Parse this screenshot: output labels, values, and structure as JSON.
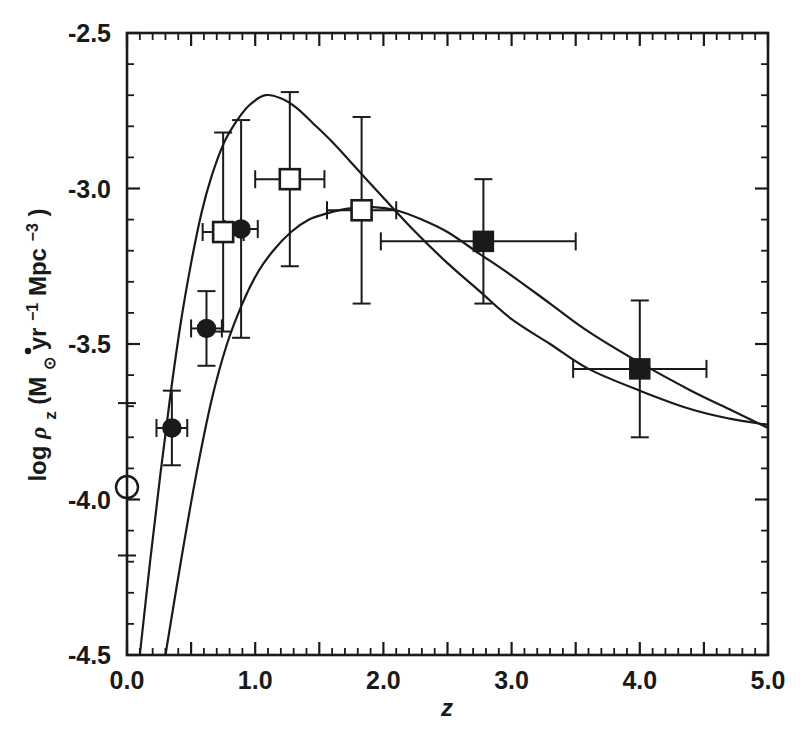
{
  "chart_data": {
    "type": "scatter",
    "title": "",
    "xlabel": "z",
    "ylabel": "log ρ̇_z (M⊙yr⁻¹ Mpc⁻³)",
    "xlim": [
      0.0,
      5.0
    ],
    "ylim": [
      -4.5,
      -2.5
    ],
    "grid": false,
    "legend": "none",
    "x_ticks": [
      "0.0",
      "1.0",
      "2.0",
      "3.0",
      "4.0",
      "5.0"
    ],
    "x_tick_values": [
      0.0,
      1.0,
      2.0,
      3.0,
      4.0,
      5.0
    ],
    "x_major_step": 0.5,
    "x_minor_step": 0.1,
    "y_ticks": [
      "-2.5",
      "-3.0",
      "-3.5",
      "-4.0",
      "-4.5"
    ],
    "y_tick_values": [
      -2.5,
      -3.0,
      -3.5,
      -4.0,
      -4.5
    ],
    "y_major_step": 0.5,
    "y_minor_step": 0.1,
    "series": [
      {
        "name": "local-uv-point",
        "marker": "open-circle",
        "points": [
          {
            "x": 0.0,
            "y": -3.96,
            "xerr_lo": 0.0,
            "xerr_hi": 0.0,
            "yerr_lo": 0.22,
            "yerr_hi": 0.27
          }
        ]
      },
      {
        "name": "filled-circles",
        "marker": "filled-circle",
        "points": [
          {
            "x": 0.35,
            "y": -3.77,
            "xerr_lo": 0.12,
            "xerr_hi": 0.12,
            "yerr_lo": 0.12,
            "yerr_hi": 0.12
          },
          {
            "x": 0.62,
            "y": -3.45,
            "xerr_lo": 0.12,
            "xerr_hi": 0.12,
            "yerr_lo": 0.12,
            "yerr_hi": 0.12
          },
          {
            "x": 0.89,
            "y": -3.13,
            "xerr_lo": 0.13,
            "xerr_hi": 0.13,
            "yerr_lo": 0.35,
            "yerr_hi": 0.35
          }
        ]
      },
      {
        "name": "open-squares",
        "marker": "open-square",
        "points": [
          {
            "x": 0.75,
            "y": -3.14,
            "xerr_lo": 0.16,
            "xerr_hi": 0.16,
            "yerr_lo": 0.32,
            "yerr_hi": 0.32
          },
          {
            "x": 1.27,
            "y": -2.97,
            "xerr_lo": 0.27,
            "xerr_hi": 0.27,
            "yerr_lo": 0.28,
            "yerr_hi": 0.28
          },
          {
            "x": 1.83,
            "y": -3.07,
            "xerr_lo": 0.27,
            "xerr_hi": 0.27,
            "yerr_lo": 0.3,
            "yerr_hi": 0.3
          }
        ]
      },
      {
        "name": "filled-squares",
        "marker": "filled-square",
        "points": [
          {
            "x": 2.78,
            "y": -3.17,
            "xerr_lo": 0.8,
            "xerr_hi": 0.72,
            "yerr_lo": 0.2,
            "yerr_hi": 0.2
          },
          {
            "x": 4.0,
            "y": -3.58,
            "xerr_lo": 0.52,
            "xerr_hi": 0.52,
            "yerr_lo": 0.22,
            "yerr_hi": 0.22
          }
        ]
      }
    ],
    "curves": [
      {
        "name": "model-upper",
        "peak_x": 1.08,
        "peak_y": -2.7,
        "points": [
          [
            0.1,
            -4.5
          ],
          [
            0.18,
            -4.2
          ],
          [
            0.26,
            -3.92
          ],
          [
            0.34,
            -3.66
          ],
          [
            0.42,
            -3.43
          ],
          [
            0.5,
            -3.24
          ],
          [
            0.58,
            -3.08
          ],
          [
            0.66,
            -2.96
          ],
          [
            0.76,
            -2.85
          ],
          [
            0.86,
            -2.78
          ],
          [
            0.96,
            -2.73
          ],
          [
            1.08,
            -2.7
          ],
          [
            1.2,
            -2.71
          ],
          [
            1.32,
            -2.74
          ],
          [
            1.45,
            -2.79
          ],
          [
            1.6,
            -2.85
          ],
          [
            1.8,
            -2.94
          ],
          [
            2.0,
            -3.03
          ],
          [
            2.25,
            -3.14
          ],
          [
            2.5,
            -3.24
          ],
          [
            2.75,
            -3.33
          ],
          [
            3.0,
            -3.42
          ],
          [
            3.3,
            -3.5
          ],
          [
            3.6,
            -3.58
          ],
          [
            4.0,
            -3.65
          ],
          [
            4.4,
            -3.71
          ],
          [
            4.7,
            -3.74
          ],
          [
            5.0,
            -3.76
          ]
        ]
      },
      {
        "name": "model-lower",
        "peak_x": 1.92,
        "peak_y": -3.06,
        "points": [
          [
            0.3,
            -4.5
          ],
          [
            0.42,
            -4.2
          ],
          [
            0.54,
            -3.92
          ],
          [
            0.66,
            -3.68
          ],
          [
            0.78,
            -3.5
          ],
          [
            0.9,
            -3.37
          ],
          [
            1.02,
            -3.27
          ],
          [
            1.14,
            -3.2
          ],
          [
            1.28,
            -3.14
          ],
          [
            1.42,
            -3.1
          ],
          [
            1.56,
            -3.08
          ],
          [
            1.72,
            -3.065
          ],
          [
            1.92,
            -3.06
          ],
          [
            2.1,
            -3.07
          ],
          [
            2.3,
            -3.1
          ],
          [
            2.5,
            -3.14
          ],
          [
            2.75,
            -3.21
          ],
          [
            3.0,
            -3.28
          ],
          [
            3.3,
            -3.37
          ],
          [
            3.6,
            -3.46
          ],
          [
            4.0,
            -3.56
          ],
          [
            4.4,
            -3.65
          ],
          [
            4.7,
            -3.71
          ],
          [
            5.0,
            -3.77
          ]
        ]
      }
    ]
  },
  "axes": {
    "y_axis_label_parts": {
      "log": "log",
      "rho": "ρ",
      "sub_z": "z",
      "open_paren": "(M",
      "sun": "⊙",
      "yr": "yr",
      "yr_exp": "−1",
      "mpc": " Mpc",
      "mpc_exp": "−3",
      "close_paren": ")"
    },
    "x_axis_label": "z"
  }
}
